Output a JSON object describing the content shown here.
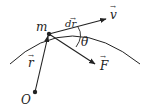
{
  "diagram": {
    "title": "",
    "colors": {
      "ink": "#222222",
      "background": "#ffffff"
    },
    "labels": {
      "mass": "m",
      "displacement": "dr",
      "velocity": "v",
      "angle": "θ",
      "position": "r",
      "force": "F",
      "origin": "O"
    },
    "vector_mark": "→"
  }
}
